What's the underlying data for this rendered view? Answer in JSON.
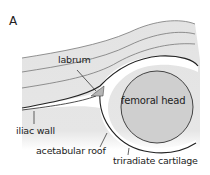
{
  "panel_label": "A",
  "labels": {
    "labrum": "labrum",
    "femoral_head": "femoral head",
    "iliac_wall": "iliac wall",
    "acetabular_roof": "acetabular roof",
    "triradiate_cartilage": "triradiate cartilage"
  },
  "colors": {
    "tissue": "#e3e3e3",
    "femoral_head": "#cfcfcf",
    "line": "#333333",
    "labrum": "#b5b5b5"
  }
}
